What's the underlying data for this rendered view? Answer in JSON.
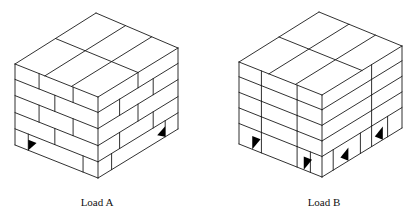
{
  "figure": {
    "loads": [
      {
        "id": "A",
        "label": "Load A",
        "pattern": "interlocking (brick) stacking",
        "label_pos": [
          97,
          196
        ],
        "geometry": {
          "T": [
            96,
            13
          ],
          "L": [
            15,
            64
          ],
          "F": [
            98,
            97
          ],
          "R": [
            178,
            48
          ],
          "height": 81
        },
        "rows_v": [
          0.19,
          0.39,
          0.6,
          0.8
        ],
        "left_joints": [
          [
            0.29,
            0.7
          ],
          [
            0.48
          ],
          [
            0.29,
            0.7
          ],
          [
            0.48
          ],
          [
            0.16,
            0.82
          ]
        ],
        "right_joints": [
          [
            0.5
          ],
          [
            0.27,
            0.69
          ],
          [
            0.5
          ],
          [
            0.27,
            0.69
          ],
          [
            0.17,
            0.84
          ]
        ],
        "top_lines_a": [
          0.5
        ],
        "top_lines_b": [
          0.36,
          0.68
        ],
        "pallet_openings_left": [
          0.16
        ],
        "pallet_openings_right": [
          0.84
        ]
      },
      {
        "id": "B",
        "label": "Load B",
        "pattern": "column stacking",
        "label_pos": [
          324,
          196
        ],
        "geometry": {
          "T": [
            319,
            12
          ],
          "L": [
            239,
            62
          ],
          "F": [
            322,
            95
          ],
          "R": [
            402,
            46
          ],
          "height": 82
        },
        "rows_v": [
          0.18,
          0.37,
          0.56,
          0.75
        ],
        "left_joints": [
          [
            0.27,
            0.7
          ],
          [
            0.27,
            0.7
          ],
          [
            0.27,
            0.7
          ],
          [
            0.27,
            0.7
          ],
          [
            0.27,
            0.7,
            0.86
          ]
        ],
        "right_joints": [
          [
            0.62
          ],
          [
            0.62
          ],
          [
            0.62
          ],
          [
            0.62
          ],
          [
            0.14,
            0.48,
            0.62,
            0.82
          ]
        ],
        "top_lines_a": [
          0.5
        ],
        "top_lines_b": [
          0.36,
          0.68
        ],
        "pallet_openings_left": [
          0.16,
          0.78
        ],
        "pallet_openings_right": [
          0.33,
          0.76
        ]
      }
    ]
  }
}
